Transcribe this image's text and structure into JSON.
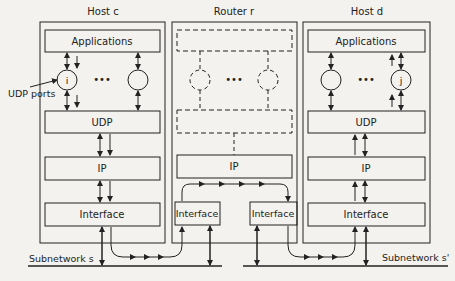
{
  "hosts": {
    "c": {
      "title": "Host c",
      "applications": "Applications",
      "udp": "UDP",
      "ip": "IP",
      "interface": "Interface",
      "port_label": "i",
      "dots": "•••"
    },
    "d": {
      "title": "Host d",
      "applications": "Applications",
      "udp": "UDP",
      "ip": "IP",
      "interface": "Interface",
      "port_label": "j",
      "dots": "•••"
    }
  },
  "router": {
    "title": "Router r",
    "ip": "IP",
    "interface_left": "Interface",
    "interface_right": "Interface",
    "dots": "•••"
  },
  "annotations": {
    "udp_ports": "UDP ports"
  },
  "subnetworks": {
    "s": "Subnetwork s",
    "s_prime": "Subnetwork s'"
  },
  "colors": {
    "line": "#222222",
    "background": "#f4f2ee"
  }
}
